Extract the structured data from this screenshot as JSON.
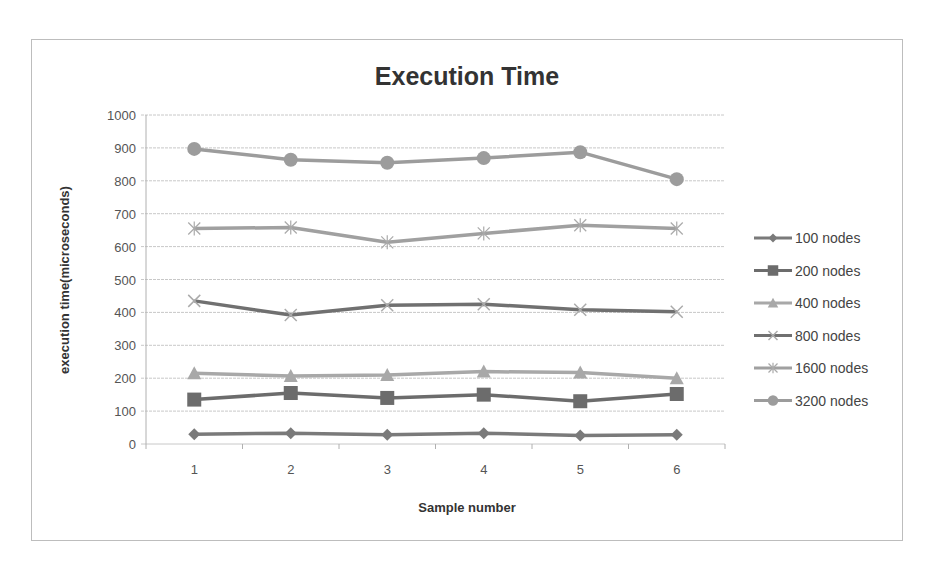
{
  "chart_data": {
    "type": "line",
    "title": "Execution Time",
    "xlabel": "Sample number",
    "ylabel": "execution time(microseconds)",
    "categories": [
      "1",
      "2",
      "3",
      "4",
      "5",
      "6"
    ],
    "ylim": [
      0,
      1000
    ],
    "yticks": [
      "0",
      "100",
      "200",
      "300",
      "400",
      "500",
      "600",
      "700",
      "800",
      "900",
      "1000"
    ],
    "grid": true,
    "legend_position": "right",
    "series": [
      {
        "name": "100 nodes",
        "marker": "diamond",
        "color": "#7a7a7a",
        "values": [
          30,
          33,
          28,
          33,
          26,
          28
        ]
      },
      {
        "name": "200 nodes",
        "marker": "square",
        "color": "#6c6c6c",
        "values": [
          135,
          155,
          140,
          150,
          130,
          152
        ]
      },
      {
        "name": "400 nodes",
        "marker": "triangle",
        "color": "#a8a8a8",
        "values": [
          215,
          207,
          210,
          220,
          217,
          200
        ]
      },
      {
        "name": "800 nodes",
        "marker": "x",
        "color": "#707070",
        "values": [
          435,
          392,
          422,
          425,
          408,
          402
        ]
      },
      {
        "name": "1600 nodes",
        "marker": "star",
        "color": "#a0a0a0",
        "values": [
          655,
          658,
          613,
          640,
          665,
          655
        ]
      },
      {
        "name": "3200 nodes",
        "marker": "circle",
        "color": "#9c9c9c",
        "values": [
          897,
          864,
          855,
          869,
          887,
          805
        ]
      }
    ]
  }
}
